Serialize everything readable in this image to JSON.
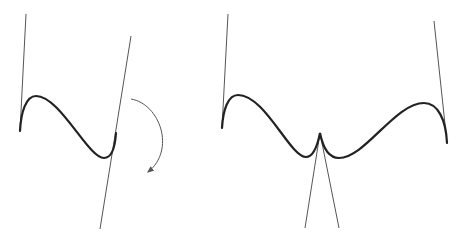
{
  "diagram": {
    "colors": {
      "background": "#ffffff",
      "curve": "#222222",
      "tangent": "#555555",
      "arrow": "#555555"
    },
    "left_figure": {
      "label": "",
      "curve": "M20,131 C21,112 26,96 36,96 C60,96 88,158 104,158 C112,158 115,148 116,133",
      "tangent_lines": [
        {
          "x1": 26,
          "y1": 14,
          "x2": 20,
          "y2": 131
        },
        {
          "x1": 131,
          "y1": 36,
          "x2": 100,
          "y2": 229
        }
      ],
      "rotation_arrow": "M131,99 C160,104 176,150 148,172"
    },
    "right_figure": {
      "label": "",
      "curve": "M222,128 C223,110 228,95 238,95 C265,95 290,157 306,157 C314,157 318,143 320,133 C322,143 326,158 339,158 C365,158 395,103 424,103 C438,103 446,120 447,143",
      "tangent_lines": [
        {
          "x1": 228,
          "y1": 14,
          "x2": 222,
          "y2": 128
        },
        {
          "x1": 434,
          "y1": 21,
          "x2": 447,
          "y2": 143
        },
        {
          "x1": 320,
          "y1": 133,
          "x2": 305,
          "y2": 228
        },
        {
          "x1": 320,
          "y1": 133,
          "x2": 339,
          "y2": 228
        }
      ]
    }
  }
}
